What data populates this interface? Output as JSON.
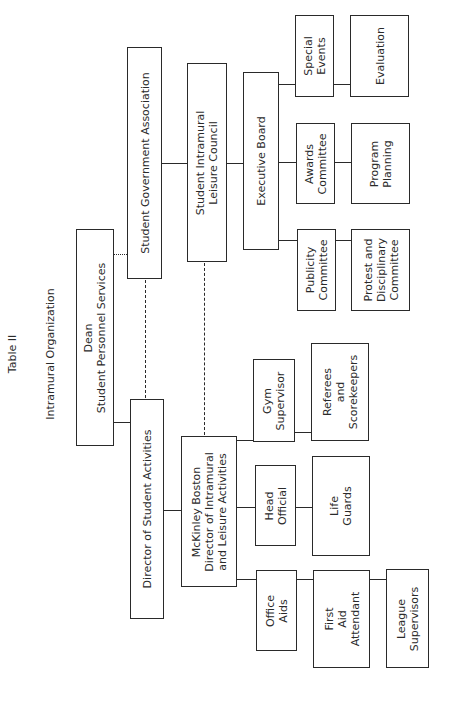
{
  "header": {
    "table_label": "Table II",
    "title": "Intramural Organization"
  },
  "nodes": {
    "dean": {
      "lines": [
        "Dean",
        "Student Personnel Services"
      ]
    },
    "sga": {
      "lines": [
        "Student Government Association"
      ]
    },
    "dir_student_activities": {
      "lines": [
        "Director of Student Activities"
      ]
    },
    "mckinley": {
      "lines": [
        "McKinley Boston",
        "Director of Intramural",
        "and Leisure Activities"
      ]
    },
    "council": {
      "lines": [
        "Student Intramural",
        "Leisure Council"
      ]
    },
    "exec_board": {
      "lines": [
        "Executive Board"
      ]
    },
    "gym_supervisor": {
      "lines": [
        "Gym",
        "Supervisor"
      ]
    },
    "head_official": {
      "lines": [
        "Head",
        "Official"
      ]
    },
    "office_aids": {
      "lines": [
        "Office",
        "Aids"
      ]
    },
    "referees": {
      "lines": [
        "Referees",
        "and",
        "Scorekeepers"
      ]
    },
    "life_guards": {
      "lines": [
        "Life",
        "Guards"
      ]
    },
    "first_aid": {
      "lines": [
        "First",
        "Aid",
        "Attendant"
      ]
    },
    "league_supervisors": {
      "lines": [
        "League",
        "Supervisors"
      ]
    },
    "special_events": {
      "lines": [
        "Special",
        "Events"
      ]
    },
    "awards": {
      "lines": [
        "Awards",
        "Committee"
      ]
    },
    "publicity": {
      "lines": [
        "Publicity",
        "Committee"
      ]
    },
    "evaluation": {
      "lines": [
        "Evaluation"
      ]
    },
    "program_planning": {
      "lines": [
        "Program",
        "Planning"
      ]
    },
    "protest": {
      "lines": [
        "Protest and",
        "Disciplinary",
        "Committee"
      ]
    }
  },
  "edges": [
    {
      "from": "dean",
      "to": "dir_student_activities",
      "style": "solid"
    },
    {
      "from": "dean",
      "to": "sga",
      "style": "dotted"
    },
    {
      "from": "dir_student_activities",
      "to": "sga",
      "style": "dashed"
    },
    {
      "from": "dir_student_activities",
      "to": "mckinley",
      "style": "solid"
    },
    {
      "from": "sga",
      "to": "council",
      "style": "solid"
    },
    {
      "from": "mckinley",
      "to": "council",
      "style": "dashed"
    },
    {
      "from": "mckinley",
      "to": "gym_supervisor",
      "style": "solid"
    },
    {
      "from": "mckinley",
      "to": "head_official",
      "style": "solid"
    },
    {
      "from": "mckinley",
      "to": "office_aids",
      "style": "solid"
    },
    {
      "from": "gym_supervisor",
      "to": "referees",
      "style": "solid"
    },
    {
      "from": "head_official",
      "to": "life_guards",
      "style": "solid"
    },
    {
      "from": "office_aids",
      "to": "first_aid",
      "style": "solid"
    },
    {
      "from": "first_aid",
      "to": "league_supervisors",
      "style": "solid"
    },
    {
      "from": "council",
      "to": "exec_board",
      "style": "solid"
    },
    {
      "from": "exec_board",
      "to": "special_events",
      "style": "solid"
    },
    {
      "from": "exec_board",
      "to": "awards",
      "style": "solid"
    },
    {
      "from": "exec_board",
      "to": "publicity",
      "style": "solid"
    },
    {
      "from": "special_events",
      "to": "evaluation",
      "style": "solid"
    },
    {
      "from": "awards",
      "to": "program_planning",
      "style": "solid"
    },
    {
      "from": "publicity",
      "to": "protest",
      "style": "solid"
    }
  ]
}
